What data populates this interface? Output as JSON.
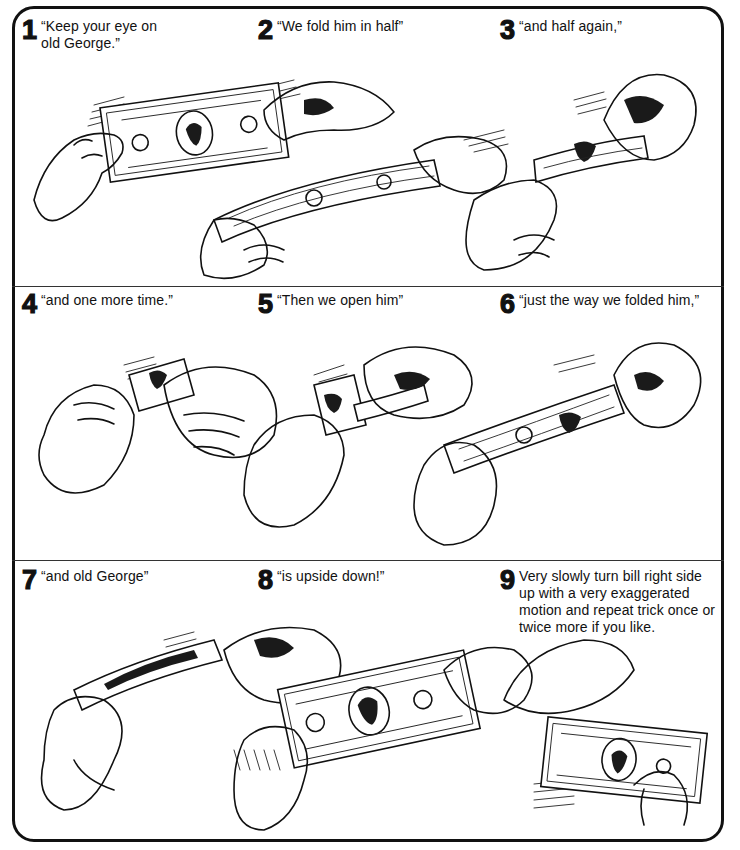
{
  "panel": {
    "rows": [
      {
        "steps": [
          {
            "number": "1",
            "caption": "“Keep your eye on old George.”",
            "caption_lines": [
              "“Keep your eye on",
              "old George.”"
            ]
          },
          {
            "number": "2",
            "caption": "“We fold him in half”"
          },
          {
            "number": "3",
            "caption": "“and half again,”"
          }
        ],
        "illustration": "hands folding a dollar bill in half, then in half again"
      },
      {
        "steps": [
          {
            "number": "4",
            "caption": "“and one more time.”"
          },
          {
            "number": "5",
            "caption": "“Then we open him”"
          },
          {
            "number": "6",
            "caption": "“just the way we folded him,”"
          }
        ],
        "illustration": "hands folding the bill small, then unfolding it"
      },
      {
        "steps": [
          {
            "number": "7",
            "caption": "“and old George”"
          },
          {
            "number": "8",
            "caption": "“is upside down!”"
          },
          {
            "number": "9",
            "caption": "Very slowly turn bill right side up with a very exaggerated motion and repeat trick once or twice more if you like.",
            "caption_lines": [
              "Very slowly turn bill right side",
              "up with a very exaggerated",
              "motion and repeat trick once or",
              "twice more if you like."
            ]
          }
        ],
        "illustration": "hands revealing the bill upside down, then turning it right side up"
      }
    ]
  },
  "colors": {
    "ink": "#111111",
    "paper": "#ffffff"
  }
}
